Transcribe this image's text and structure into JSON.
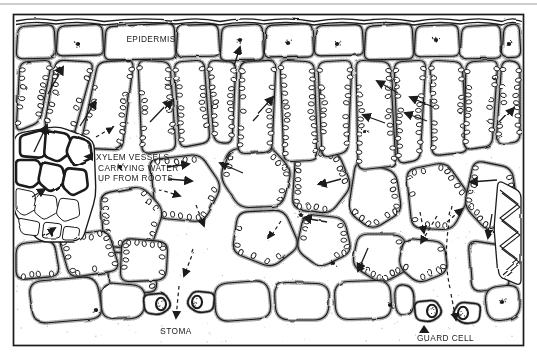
{
  "diagram": {
    "labels": {
      "epidermis": "EPIDERMIS",
      "xylem_line1": "XYLEM VESSELS",
      "xylem_line2": "CARRYING WATER",
      "xylem_line3": "UP FROM ROOTS",
      "stoma": "STOMA",
      "guard_cell": "GUARD CELL"
    },
    "colors": {
      "ink": "#1a1a1a",
      "paper": "#ffffff",
      "stipple": "#555555",
      "scan_line": "#bdbdbd"
    }
  }
}
